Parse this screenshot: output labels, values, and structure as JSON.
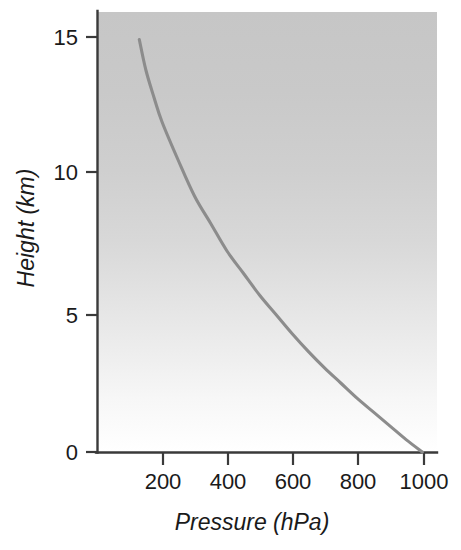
{
  "chart_data": {
    "type": "line",
    "title": "",
    "subtitle": "",
    "xlabel": "Pressure (hPa)",
    "ylabel": "Height (km)",
    "xlim": [
      0,
      1045
    ],
    "ylim": [
      0,
      16
    ],
    "xticks": [
      200,
      400,
      600,
      800,
      1000
    ],
    "xtick_labels": [
      "200",
      "400",
      "600",
      "800",
      "1000"
    ],
    "yticks": [
      0,
      5,
      10,
      15
    ],
    "ytick_labels": [
      "0",
      "5",
      "10",
      "15"
    ],
    "grid": false,
    "legend": "none",
    "series": [
      {
        "name": "Atmospheric pressure profile",
        "x_label": "Pressure (hPa)",
        "y_label": "Height (km)",
        "x": [
          1000,
          950,
          900,
          850,
          800,
          750,
          700,
          650,
          600,
          550,
          500,
          450,
          400,
          350,
          300,
          250,
          200,
          175,
          150,
          130
        ],
        "y": [
          0.0,
          0.45,
          0.95,
          1.45,
          1.95,
          2.5,
          3.05,
          3.65,
          4.3,
          5.0,
          5.7,
          6.5,
          7.3,
          8.3,
          9.3,
          10.6,
          12.0,
          12.9,
          13.9,
          15.0
        ]
      }
    ],
    "annotations": [],
    "colors": {
      "curve": "#8c8c8c",
      "axis": "#3a3a3a",
      "text": "#1a1a1a",
      "plot_bg_top": "#c8c8c8",
      "plot_bg_bottom": "#ffffff",
      "page_bg": "#ffffff"
    }
  },
  "axes": {
    "x_axis_title": "Pressure (hPa)",
    "y_axis_title": "Height (km)",
    "x_tick_labels": [
      "200",
      "400",
      "600",
      "800",
      "1000"
    ],
    "y_tick_labels": [
      "15",
      "10",
      "5",
      "0"
    ]
  }
}
